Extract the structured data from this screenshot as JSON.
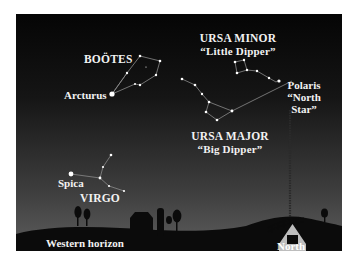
{
  "figure": {
    "colors": {
      "sky_top": "#050505",
      "sky_bottom": "#5a5a5a",
      "ground": "#0c0c0c",
      "star": "#ffffff",
      "line": "#8a8a8a",
      "text": "#f2f2f2"
    },
    "constellations": [
      {
        "name": "BOÖTES",
        "subtitle": ""
      },
      {
        "name": "URSA MINOR",
        "subtitle": "“Little Dipper”"
      },
      {
        "name": "URSA MAJOR",
        "subtitle": "“Big Dipper”"
      },
      {
        "name": "VIRGO",
        "subtitle": ""
      }
    ],
    "stars": [
      {
        "name": "Arcturus"
      },
      {
        "name": "Polaris",
        "note_line1": "“North",
        "note_line2": "Star”"
      },
      {
        "name": "Spica"
      }
    ],
    "horizon_labels": {
      "west": "Western horizon",
      "north": "North"
    },
    "landmarks": [
      "trees",
      "barn",
      "silo",
      "radio-tower",
      "bridge",
      "tree"
    ]
  }
}
